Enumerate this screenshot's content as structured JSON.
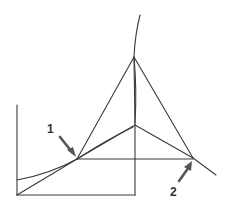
{
  "diagram": {
    "labels": [
      {
        "id": "1",
        "text": "1",
        "x": 48,
        "y": 133
      },
      {
        "id": "2",
        "text": "2",
        "x": 171,
        "y": 195
      }
    ],
    "points": {
      "p1": [
        77,
        159
      ],
      "p2": [
        193,
        158
      ],
      "apex": [
        134,
        57
      ],
      "mid": [
        135,
        125
      ],
      "corner_bl": [
        17,
        195
      ],
      "corner_br": [
        135,
        195
      ],
      "left_top": [
        17,
        105
      ]
    },
    "colors": {
      "line": "#3a3a3a",
      "arrow": "#555555",
      "background": "#ffffff"
    }
  }
}
